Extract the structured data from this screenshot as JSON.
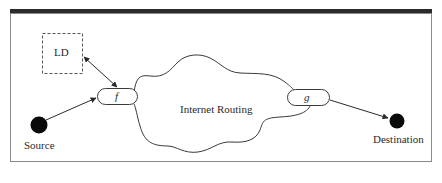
{
  "diagram": {
    "type": "network-routing-diagram",
    "nodes": {
      "ld": {
        "label": "LD",
        "shape": "dashed-box"
      },
      "f": {
        "label": "f",
        "shape": "rounded-pill"
      },
      "g": {
        "label": "g",
        "shape": "rounded-pill"
      },
      "source": {
        "label": "Source",
        "shape": "filled-circle"
      },
      "destination": {
        "label": "Destination",
        "shape": "filled-circle"
      },
      "cloud": {
        "label": "Internet Routing",
        "shape": "cloud"
      }
    },
    "edges": [
      {
        "from": "ld",
        "to": "f",
        "style": "double-arrow"
      },
      {
        "from": "source",
        "to": "f",
        "style": "arrow"
      },
      {
        "from": "g",
        "to": "destination",
        "style": "arrow"
      }
    ],
    "colors": {
      "stroke": "#3a3a3a",
      "frame": "#7a7a7a",
      "top_rule": "#2b2b2b",
      "node_fill": "#0a0a0a",
      "background": "#ffffff"
    }
  },
  "caption": {
    "visible": "partially clipped, unreadable"
  }
}
